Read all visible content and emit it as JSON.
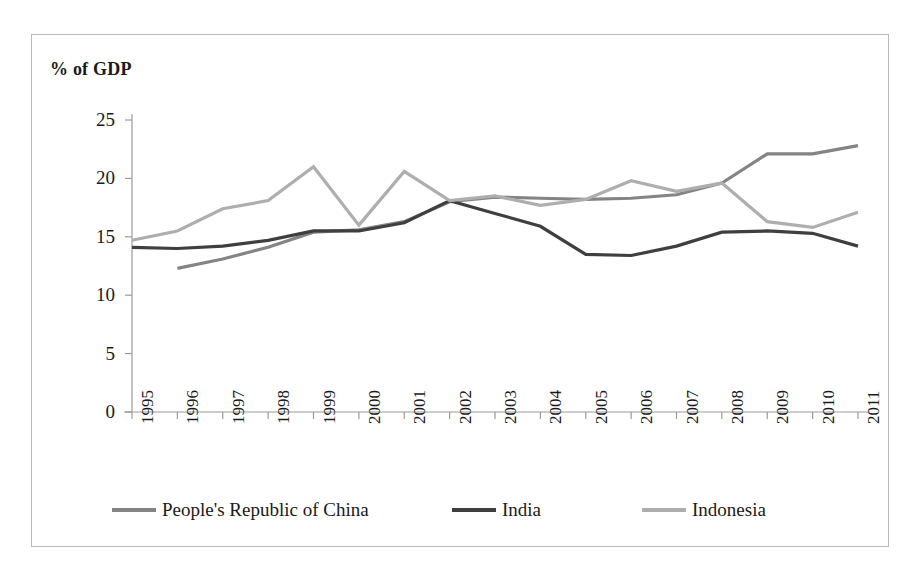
{
  "chart_data": {
    "type": "line",
    "title": "% of GDP",
    "xlabel": "",
    "ylabel": "% of GDP",
    "ylim": [
      0,
      25
    ],
    "yticks": [
      0,
      5,
      10,
      15,
      20,
      25
    ],
    "grid": false,
    "legend_position": "bottom",
    "x": [
      1995,
      1996,
      1997,
      1998,
      1999,
      2000,
      2001,
      2002,
      2003,
      2004,
      2005,
      2006,
      2007,
      2008,
      2009,
      2010,
      2011
    ],
    "categories": [
      "1995",
      "1996",
      "1997",
      "1998",
      "1999",
      "2000",
      "2001",
      "2002",
      "2003",
      "2004",
      "2005",
      "2006",
      "2007",
      "2008",
      "2009",
      "2010",
      "2011"
    ],
    "series": [
      {
        "name": "People's Republic of China",
        "color": "#848484",
        "values": [
          null,
          12.3,
          13.1,
          14.1,
          15.4,
          15.6,
          16.3,
          18.0,
          18.4,
          18.3,
          18.2,
          18.3,
          18.6,
          19.6,
          22.1,
          22.1,
          22.8
        ]
      },
      {
        "name": "India",
        "color": "#3f3f3f",
        "values": [
          14.1,
          14.0,
          14.2,
          14.7,
          15.5,
          15.5,
          16.2,
          18.1,
          17.0,
          15.9,
          13.5,
          13.4,
          14.2,
          15.4,
          15.5,
          15.3,
          14.2
        ]
      },
      {
        "name": "Indonesia",
        "color": "#aeaeae",
        "values": [
          14.7,
          15.5,
          17.4,
          18.1,
          21.0,
          16.0,
          20.6,
          18.1,
          18.5,
          17.7,
          18.2,
          19.8,
          18.9,
          19.6,
          16.3,
          15.8,
          17.1
        ]
      }
    ]
  },
  "legend": {
    "items": [
      {
        "label": "People's Republic of China",
        "color": "#848484"
      },
      {
        "label": "India",
        "color": "#3f3f3f"
      },
      {
        "label": "Indonesia",
        "color": "#aeaeae"
      }
    ]
  },
  "axis": {
    "y_tick_labels": [
      "25",
      "20",
      "15",
      "10",
      "5",
      "0"
    ],
    "x_tick_labels": [
      "1995",
      "1996",
      "1997",
      "1998",
      "1999",
      "2000",
      "2001",
      "2002",
      "2003",
      "2004",
      "2005",
      "2006",
      "2007",
      "2008",
      "2009",
      "2010",
      "2011"
    ]
  }
}
